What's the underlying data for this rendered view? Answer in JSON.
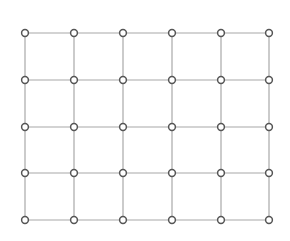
{
  "diagram": {
    "type": "grid-graph",
    "rows": 5,
    "cols": 6,
    "x_positions": [
      25,
      74,
      123,
      172,
      221,
      269
    ],
    "y_positions": [
      33,
      80,
      127,
      173,
      220
    ],
    "node": {
      "shape": "circle",
      "radius": 3.4,
      "fill": "#ffffff",
      "stroke": "#555555",
      "stroke_width": 1.5
    },
    "edge": {
      "color": "#a8a8a8",
      "width": 1.2
    },
    "background": "#ffffff"
  }
}
